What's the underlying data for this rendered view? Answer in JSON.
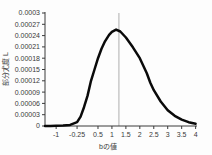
{
  "chart_data": {
    "type": "line",
    "title": "",
    "xlabel": "bの値",
    "ylabel": "部分尤度 L",
    "legend": "none",
    "grid": false,
    "xlim": [
      -1.4,
      4.05
    ],
    "ylim": [
      0,
      0.0003
    ],
    "x_ticks": [
      {
        "value": -1,
        "label": "-1"
      },
      {
        "value": -0.25,
        "label": "-0.25"
      },
      {
        "value": 0.5,
        "label": "0.5"
      },
      {
        "value": 1,
        "label": "1"
      },
      {
        "value": 1.5,
        "label": "1.5"
      },
      {
        "value": 2,
        "label": "2"
      },
      {
        "value": 2.5,
        "label": "2.5"
      },
      {
        "value": 3,
        "label": "3"
      },
      {
        "value": 3.5,
        "label": "3.5"
      },
      {
        "value": 4,
        "label": "4"
      }
    ],
    "y_ticks": [
      {
        "value": 0.0003,
        "label": "0.0003"
      },
      {
        "value": 0.00027,
        "label": "0.00027"
      },
      {
        "value": 0.00024,
        "label": "0.00024"
      },
      {
        "value": 0.00021,
        "label": "0.00021"
      },
      {
        "value": 0.00018,
        "label": "0.00018"
      },
      {
        "value": 0.00015,
        "label": "0.00015"
      },
      {
        "value": 0.00012,
        "label": "0.00012"
      },
      {
        "value": 9e-05,
        "label": "0.00009"
      },
      {
        "value": 6e-05,
        "label": "0.00006"
      },
      {
        "value": 3e-05,
        "label": "0.00003"
      },
      {
        "value": 0,
        "label": "0"
      }
    ],
    "reference_line_x": 1.25,
    "series": [
      {
        "name": "partial-likelihood-curve",
        "color": "#0a0a0a",
        "peak": {
          "x": 1.15,
          "y": 0.000256
        },
        "points": [
          [
            -1.4,
            1e-07
          ],
          [
            -1.2,
            2e-07
          ],
          [
            -1.0,
            5e-07
          ],
          [
            -0.75,
            1e-06
          ],
          [
            -0.5,
            3e-06
          ],
          [
            -0.25,
            1e-05
          ],
          [
            -0.125,
            2.5e-05
          ],
          [
            0,
            5e-05
          ],
          [
            0.125,
            8e-05
          ],
          [
            0.25,
            0.00012
          ],
          [
            0.375,
            0.00015
          ],
          [
            0.5,
            0.00018
          ],
          [
            0.625,
            0.000205
          ],
          [
            0.75,
            0.000225
          ],
          [
            0.9,
            0.000242
          ],
          [
            1.0,
            0.00025
          ],
          [
            1.15,
            0.000256
          ],
          [
            1.3,
            0.000251
          ],
          [
            1.5,
            0.000235
          ],
          [
            1.75,
            0.000209
          ],
          [
            2.0,
            0.00018
          ],
          [
            2.125,
            0.00016
          ],
          [
            2.25,
            0.00014
          ],
          [
            2.375,
            0.000115
          ],
          [
            2.5,
            9.5e-05
          ],
          [
            2.75,
            6.5e-05
          ],
          [
            3.0,
            4.2e-05
          ],
          [
            3.25,
            2.7e-05
          ],
          [
            3.5,
            1.7e-05
          ],
          [
            3.75,
            1e-05
          ],
          [
            4.0,
            6e-06
          ]
        ]
      }
    ],
    "colors": {
      "axis": "#3a3a3a",
      "tick_text": "#3a3a3a",
      "reference_line": "#9a9a9a",
      "background": "#fdfdfd"
    }
  }
}
